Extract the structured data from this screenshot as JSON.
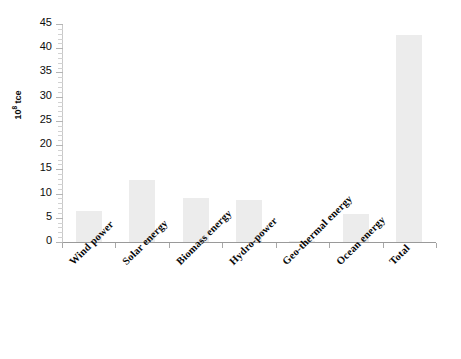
{
  "chart_data": {
    "type": "bar",
    "title": "",
    "subtitle": "",
    "xlabel": "",
    "ylabel": "10⁸ tce",
    "ylabel_base": "10",
    "ylabel_exponent": "8",
    "ylabel_unit": " tce",
    "categories": [
      "Wind power",
      "Solar energy",
      "Biomass energy",
      "Hydro-power",
      "Geo-thermal energy",
      "Ocean energy",
      "Total"
    ],
    "values": [
      6.5,
      12.7,
      9.0,
      8.7,
      0.2,
      5.7,
      42.7
    ],
    "ylim": [
      0,
      45
    ],
    "ytick_values": [
      0,
      5,
      10,
      15,
      20,
      25,
      30,
      35,
      40,
      45
    ],
    "ytick_labels": [
      "0",
      "5",
      "10",
      "15",
      "20",
      "25",
      "30",
      "35",
      "40",
      "45"
    ],
    "minor_tick_step": 1,
    "grid": false,
    "legend": null,
    "legend_position": "none",
    "bar_color": "#ececec",
    "axis_color": "#9a9a9a",
    "text_color": "#0a0a0a"
  }
}
